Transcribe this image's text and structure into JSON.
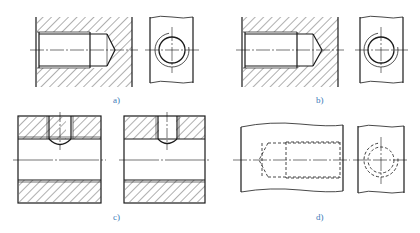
{
  "figure": {
    "panels": [
      {
        "id": "a",
        "label": "a)",
        "content": "Sectioned blind tapped hole with end view (thread shown with hatching to minor diameter)"
      },
      {
        "id": "b",
        "label": "b)",
        "content": "Sectioned blind tapped hole with end view (alternate representation)"
      },
      {
        "id": "c",
        "label": "c)",
        "content": "Two sectioned parts with cross-drilled tapped hole intersecting main bore"
      },
      {
        "id": "d",
        "label": "d)",
        "content": "Unsectioned blind tapped hole shown with hidden (dashed) lines and end view"
      }
    ]
  },
  "colors": {
    "line": "#1a1a1a",
    "label": "#3a7ab8",
    "background": "#ffffff"
  }
}
